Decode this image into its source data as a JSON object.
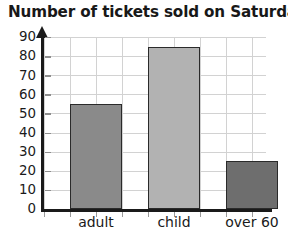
{
  "chart_data": {
    "type": "bar",
    "title": "Number of tickets sold on Saturday",
    "xlabel": "",
    "ylabel": "",
    "categories": [
      "adult",
      "child",
      "over 60"
    ],
    "values": [
      55,
      85,
      25
    ],
    "ylim": [
      0,
      90
    ],
    "ytick_step": 10,
    "yticks": [
      0,
      10,
      20,
      30,
      40,
      50,
      60,
      70,
      80,
      90
    ],
    "ytick_labels": [
      "0",
      "10",
      "20",
      "30",
      "40",
      "50",
      "60",
      "70",
      "80",
      "90"
    ],
    "grid": true,
    "legend": null,
    "bar_colors": [
      "#8a8a8a",
      "#b2b2b2",
      "#6e6e6e"
    ],
    "bar_edge_color": "#2a2a2a",
    "grid_color": "#d2d2d2",
    "axis_color": "#1a1a1a",
    "title_color": "#181818"
  }
}
